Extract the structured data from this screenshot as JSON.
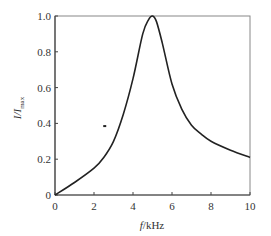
{
  "chart_data": {
    "type": "line",
    "title": "",
    "xlabel": "f/kHz",
    "ylabel": "I/I_max",
    "xlim": [
      0,
      10
    ],
    "ylim": [
      0,
      1.0
    ],
    "xticks": [
      0,
      2,
      4,
      6,
      8,
      10
    ],
    "yticks": [
      0,
      0.2,
      0.4,
      0.6,
      0.8,
      1.0
    ],
    "xtick_labels": [
      "0",
      "2",
      "4",
      "6",
      "8",
      "10"
    ],
    "ytick_labels": [
      "0",
      "0.2",
      "0.4",
      "0.6",
      "0.8",
      "1.0"
    ],
    "grid": false,
    "legend": null,
    "series": [
      {
        "name": "resonance curve",
        "x": [
          0,
          1,
          2,
          2.5,
          3,
          3.5,
          4,
          4.5,
          4.8,
          5,
          5.2,
          5.5,
          6,
          6.5,
          7,
          7.5,
          8,
          9,
          10
        ],
        "y": [
          0,
          0.07,
          0.15,
          0.21,
          0.3,
          0.45,
          0.65,
          0.9,
          0.98,
          1.0,
          0.97,
          0.85,
          0.62,
          0.48,
          0.39,
          0.34,
          0.3,
          0.25,
          0.21
        ]
      }
    ],
    "annotations": [
      {
        "type": "marker",
        "x": 2.55,
        "y": 0.385,
        "shape": "dash"
      }
    ]
  },
  "colors": {
    "line": "#222222",
    "frame": "#888888",
    "text": "#333333"
  }
}
